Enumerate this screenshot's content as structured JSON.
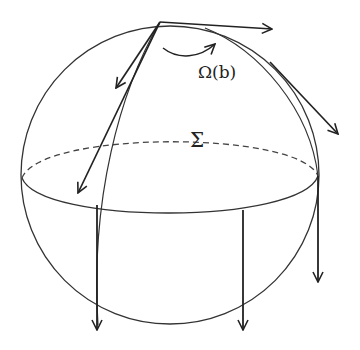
{
  "diagram": {
    "type": "sphere-vector-field",
    "labels": {
      "omega": "Ω(b)",
      "sigma": "Σ"
    },
    "colors": {
      "stroke": "#222222",
      "background": "#ffffff"
    },
    "elements": [
      "sphere-outline",
      "equator-front-solid",
      "equator-back-dashed",
      "meridian-curve",
      "rotation-arrow",
      "tangent-arrows-from-top",
      "downward-arrows-from-equator"
    ]
  }
}
